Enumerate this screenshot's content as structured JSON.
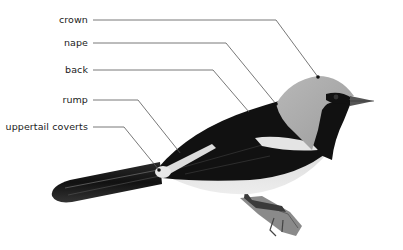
{
  "diagram": {
    "colors": {
      "background": "#ffffff",
      "leader_line": "#555555",
      "label_text": "#1a1a1a",
      "plumage_dark": "#111111",
      "plumage_grey": "#a9a9a9",
      "plumage_light": "#e6e6e6"
    },
    "labels": [
      {
        "id": "crown",
        "text": "crown"
      },
      {
        "id": "nape",
        "text": "nape"
      },
      {
        "id": "back",
        "text": "back"
      },
      {
        "id": "rump",
        "text": "rump"
      },
      {
        "id": "uppertail-coverts",
        "text": "uppertail coverts"
      }
    ]
  }
}
